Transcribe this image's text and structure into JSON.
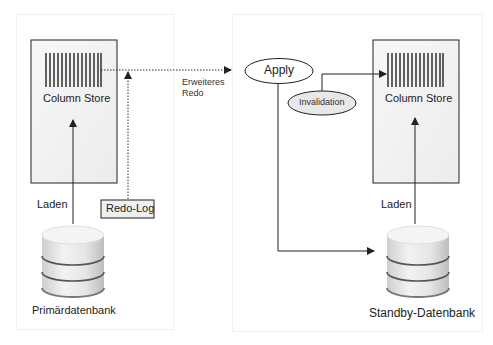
{
  "diagram": {
    "type": "system-replication",
    "primary": {
      "column_store_label": "Column Store",
      "load_label": "Laden",
      "redo_log_label": "Redo-Log",
      "database_label": "Primärdatenbank"
    },
    "transfer": {
      "label_line1": "Erweiteres",
      "label_line2": "Redo"
    },
    "standby": {
      "apply_label": "Apply",
      "invalidation_label": "Invalidation",
      "column_store_label": "Column Store",
      "load_label": "Laden",
      "database_label": "Standby-Datenbank"
    },
    "colors": {
      "line": "#222222",
      "box_fill": "#f4f4f4",
      "redo_fill": "#efefef",
      "invalidation_fill": "#e8e8e8",
      "panel_border": "#f0f0f0"
    }
  }
}
